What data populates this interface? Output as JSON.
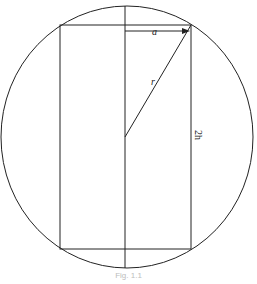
{
  "diagram": {
    "labels": {
      "half_width": "a",
      "radius": "r",
      "height": "2h"
    },
    "caption": "Fig. 1.1",
    "colors": {
      "stroke": "#222222",
      "background": "#ffffff"
    }
  }
}
